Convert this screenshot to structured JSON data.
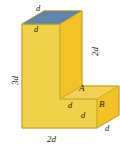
{
  "figure": {
    "colors": {
      "front_face": "#f0d24a",
      "side_face": "#f3c326",
      "top_face": "#5b7fa8",
      "top_face_highlight": "#6e8fb4",
      "shelf_top_face": "#f2cf55",
      "outline": "#c9a321",
      "label_text": "#1a1a1a",
      "background": "#ffffff"
    },
    "labels": [
      {
        "name": "top-depth-label",
        "text": "d",
        "x": 36,
        "y": 8,
        "size": "sm",
        "rotated": false
      },
      {
        "name": "top-front-edge-label",
        "text": "d",
        "x": 34,
        "y": 29,
        "size": "sm",
        "rotated": false
      },
      {
        "name": "upper-right-height-label",
        "text": "2d",
        "x": 84,
        "y": 42,
        "size": "md",
        "rotated": true
      },
      {
        "name": "left-height-label",
        "text": "3d",
        "x": 5,
        "y": 71,
        "size": "md",
        "rotated": true
      },
      {
        "name": "vertex-a-label",
        "text": "A",
        "x": 80,
        "y": 88,
        "size": "md",
        "rotated": false
      },
      {
        "name": "notch-width-label",
        "text": "d",
        "x": 69,
        "y": 104,
        "size": "sm",
        "rotated": false
      },
      {
        "name": "notch-height-label",
        "text": "d",
        "x": 82,
        "y": 114,
        "size": "sm",
        "rotated": false
      },
      {
        "name": "vertex-b-label",
        "text": "B",
        "x": 99,
        "y": 104,
        "size": "md",
        "rotated": false
      },
      {
        "name": "lower-right-depth-label",
        "text": "d",
        "x": 105,
        "y": 127,
        "size": "sm",
        "rotated": false
      },
      {
        "name": "bottom-width-label",
        "text": "2d",
        "x": 48,
        "y": 139,
        "size": "md",
        "rotated": false
      }
    ],
    "edge_values": {
      "top_depth": "d",
      "top_front_edge": "d",
      "upper_right_height": "2d",
      "left_height": "3d",
      "notch_width": "d",
      "notch_height": "d",
      "lower_right_depth": "d",
      "bottom_width": "2d"
    },
    "vertices": {
      "a": "A",
      "b": "B"
    }
  }
}
